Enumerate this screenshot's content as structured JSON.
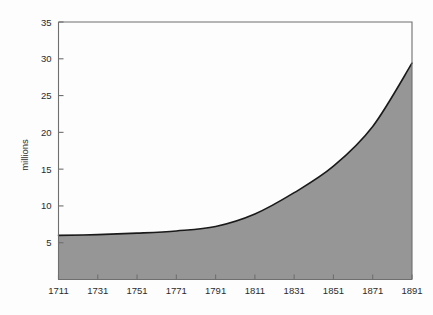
{
  "chart_data": {
    "type": "area",
    "title": "",
    "subtitle": "",
    "xlabel": "",
    "ylabel": "millions",
    "x": [
      1711,
      1731,
      1751,
      1771,
      1791,
      1811,
      1831,
      1851,
      1871,
      1891
    ],
    "values": [
      6.0,
      6.1,
      6.3,
      6.6,
      7.2,
      8.9,
      11.8,
      15.4,
      20.8,
      29.4
    ],
    "categories": [
      "1711",
      "1731",
      "1751",
      "1771",
      "1791",
      "1811",
      "1831",
      "1851",
      "1871",
      "1891"
    ],
    "series": [
      {
        "name": "population",
        "values": [
          6.0,
          6.1,
          6.3,
          6.6,
          7.2,
          8.9,
          11.8,
          15.4,
          20.8,
          29.4
        ]
      }
    ],
    "xlim": [
      1711,
      1891
    ],
    "ylim": [
      0,
      35
    ],
    "xticks": [
      1711,
      1731,
      1751,
      1771,
      1791,
      1811,
      1831,
      1851,
      1871,
      1891
    ],
    "yticks": [
      5,
      10,
      15,
      20,
      25,
      30,
      35
    ],
    "xtick_labels": [
      "1711",
      "1731",
      "1751",
      "1771",
      "1791",
      "1811",
      "1831",
      "1851",
      "1871",
      "1891"
    ],
    "ytick_labels": [
      "5",
      "10",
      "15",
      "20",
      "25",
      "30",
      "35"
    ],
    "grid": false,
    "legend": false,
    "legend_position": "none",
    "fill_color": "#969696",
    "line_color": "#1a1a1a",
    "axis_color": "#6f6f6f",
    "background_color": "#fdfdfd",
    "annotations": []
  }
}
